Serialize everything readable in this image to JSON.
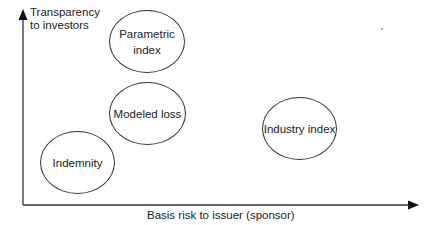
{
  "diagram": {
    "y_axis": {
      "label_lines": [
        "Transparency",
        "to investors"
      ],
      "direction": "up"
    },
    "x_axis": {
      "label": "Basis risk to issuer (sponsor)",
      "direction": "right"
    },
    "nodes": [
      {
        "id": "parametric-index",
        "label_lines": [
          "Parametric",
          "index"
        ],
        "transparency": "highest",
        "basis_risk": "low-moderate"
      },
      {
        "id": "modeled-loss",
        "label_lines": [
          "Modeled loss"
        ],
        "transparency": "moderate",
        "basis_risk": "low-moderate"
      },
      {
        "id": "indemnity",
        "label_lines": [
          "Indemnity"
        ],
        "transparency": "lowest",
        "basis_risk": "lowest"
      },
      {
        "id": "industry-index",
        "label_lines": [
          "Industry index"
        ],
        "transparency": "moderate",
        "basis_risk": "highest"
      }
    ],
    "colors": {
      "line": "#333333",
      "text": "#222222",
      "background": "#ffffff"
    }
  }
}
